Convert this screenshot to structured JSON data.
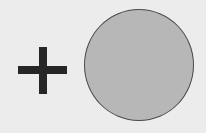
{
  "diagram": {
    "background_color": "#ececec",
    "elements": [
      {
        "type": "plus-sign",
        "color": "#262626"
      },
      {
        "type": "circle",
        "fill": "#b7b7b7",
        "stroke": "#4a4a4a"
      }
    ]
  }
}
